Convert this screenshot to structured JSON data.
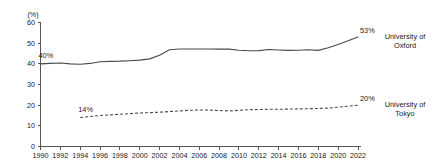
{
  "chart_data": {
    "type": "line",
    "title": "",
    "subtitle": "",
    "xlabel": "",
    "ylabel": "",
    "yunit": "(%)",
    "xlim": [
      1990,
      2022
    ],
    "ylim": [
      0,
      60
    ],
    "grid": false,
    "legend_position": "right-inline",
    "y_ticks": [
      "0",
      "10",
      "20",
      "30",
      "40",
      "50",
      "60"
    ],
    "y_tick_values": [
      0,
      10,
      20,
      30,
      40,
      50,
      60
    ],
    "x_ticks": [
      "1990",
      "1992",
      "1994",
      "1996",
      "1998",
      "2000",
      "2002",
      "2004",
      "2006",
      "2008",
      "2010",
      "2012",
      "2014",
      "2016",
      "2018",
      "2020",
      "2022"
    ],
    "x_tick_values": [
      1990,
      1992,
      1994,
      1996,
      1998,
      2000,
      2002,
      2004,
      2006,
      2008,
      2010,
      2012,
      2014,
      2016,
      2018,
      2020,
      2022
    ],
    "series": [
      {
        "name": "University of Oxford",
        "style": "solid",
        "label_line1": "University of",
        "label_line2": "Oxford",
        "start_annotation": "40%",
        "end_annotation": "53%",
        "x": [
          1990,
          1991,
          1992,
          1993,
          1994,
          1995,
          1996,
          1997,
          1998,
          1999,
          2000,
          2001,
          2002,
          2003,
          2004,
          2005,
          2006,
          2007,
          2008,
          2009,
          2010,
          2011,
          2012,
          2013,
          2014,
          2015,
          2016,
          2017,
          2018,
          2019,
          2020,
          2021,
          2022
        ],
        "values": [
          40,
          40.2,
          40.4,
          40,
          39.8,
          40.2,
          41,
          41.2,
          41.3,
          41.5,
          41.8,
          42.4,
          44.2,
          46.8,
          47.2,
          47.2,
          47.2,
          47.2,
          47.1,
          47.1,
          46.6,
          46.3,
          46.4,
          46.9,
          46.7,
          46.5,
          46.6,
          46.8,
          46.5,
          47.8,
          49.4,
          51.2,
          53
        ]
      },
      {
        "name": "University of Tokyo",
        "style": "dashed",
        "label_line1": "University of",
        "label_line2": "Tokyo",
        "start_annotation": "14%",
        "end_annotation": "20%",
        "x": [
          1994,
          1995,
          1996,
          1997,
          1998,
          1999,
          2000,
          2001,
          2002,
          2003,
          2004,
          2005,
          2006,
          2007,
          2008,
          2009,
          2010,
          2011,
          2012,
          2013,
          2014,
          2015,
          2016,
          2017,
          2018,
          2019,
          2020,
          2021,
          2022
        ],
        "values": [
          14,
          14.5,
          15,
          15.3,
          15.6,
          15.9,
          16.2,
          16.4,
          16.6,
          16.9,
          17.2,
          17.5,
          17.7,
          17.6,
          17.4,
          17.2,
          17.5,
          17.8,
          17.9,
          18.0,
          18.0,
          18.1,
          18.2,
          18.3,
          18.4,
          18.6,
          19.0,
          19.5,
          20
        ]
      }
    ]
  }
}
